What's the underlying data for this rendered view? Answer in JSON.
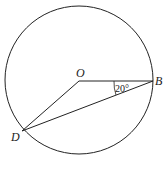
{
  "diagram": {
    "circle": {
      "cx": 79,
      "cy": 80,
      "r": 74
    },
    "points": {
      "O": {
        "label": "O",
        "x": 79,
        "y": 81
      },
      "B": {
        "label": "B",
        "x": 153,
        "y": 81
      },
      "D": {
        "label": "D",
        "x": 22,
        "y": 131
      }
    },
    "segments": [
      [
        "O",
        "B"
      ],
      [
        "O",
        "D"
      ],
      [
        "D",
        "B"
      ]
    ],
    "angle": {
      "vertex": "B",
      "between": [
        "O",
        "D"
      ],
      "label": "20°"
    },
    "stroke_color": "#222222"
  }
}
